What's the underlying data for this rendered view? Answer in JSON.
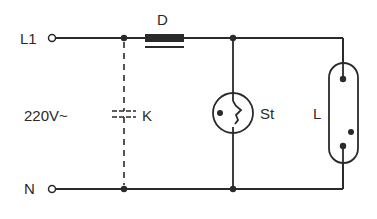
{
  "diagram": {
    "title": "",
    "type": "fluorescent-lamp-circuit",
    "colors": {
      "wire": "#2a2a2a",
      "background": "#ffffff"
    },
    "terminals": [
      {
        "id": "L1",
        "label": "L1"
      },
      {
        "id": "N",
        "label": "N"
      }
    ],
    "supply": {
      "label": "220V~"
    },
    "components": [
      {
        "id": "D",
        "label": "D",
        "kind": "choke"
      },
      {
        "id": "K",
        "label": "K",
        "kind": "capacitor"
      },
      {
        "id": "St",
        "label": "St",
        "kind": "starter"
      },
      {
        "id": "L",
        "label": "L",
        "kind": "fluorescent-tube"
      }
    ]
  }
}
